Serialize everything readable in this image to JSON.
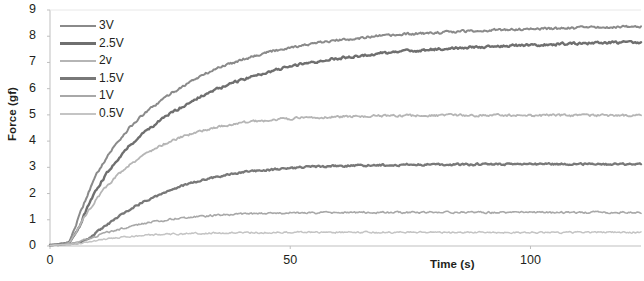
{
  "chart_data": {
    "type": "line",
    "title": "",
    "xlabel": "Time (s)",
    "ylabel": "Force (gf)",
    "xlim": [
      0,
      123
    ],
    "ylim": [
      0,
      9
    ],
    "xticks": [
      0,
      50,
      100
    ],
    "yticks": [
      0,
      1,
      2,
      3,
      4,
      5,
      6,
      7,
      8,
      9
    ],
    "grid": false,
    "legend_position": "top-left inside plot",
    "series": [
      {
        "name": "3V",
        "color": "#8a8a8a",
        "linewidth": 2.0,
        "plateau": 8.2,
        "delay": 3.5,
        "tau": 22,
        "noise": 0.075,
        "x": [
          0,
          2,
          4,
          6,
          8,
          10,
          12,
          14,
          16,
          18,
          20,
          25,
          30,
          35,
          40,
          45,
          50,
          55,
          60,
          65,
          70,
          75,
          80,
          85,
          90,
          95,
          100,
          105,
          110,
          115,
          120,
          123
        ],
        "values": [
          0.05,
          0.08,
          0.15,
          1.1,
          2.05,
          2.85,
          3.45,
          3.95,
          4.4,
          4.78,
          5.1,
          5.8,
          6.35,
          6.8,
          7.12,
          7.38,
          7.58,
          7.72,
          7.85,
          7.95,
          8.02,
          8.08,
          8.13,
          8.18,
          8.22,
          8.25,
          8.28,
          8.3,
          8.32,
          8.34,
          8.36,
          8.38
        ]
      },
      {
        "name": "2.5V",
        "color": "#6f6f6f",
        "linewidth": 2.4,
        "plateau": 7.5,
        "delay": 4.5,
        "tau": 26,
        "noise": 0.075,
        "x": [
          0,
          2,
          4,
          6,
          8,
          10,
          12,
          14,
          16,
          18,
          20,
          25,
          30,
          35,
          40,
          45,
          50,
          55,
          60,
          65,
          70,
          75,
          80,
          85,
          90,
          95,
          100,
          105,
          110,
          115,
          120,
          123
        ],
        "values": [
          0.04,
          0.06,
          0.12,
          0.7,
          1.55,
          2.25,
          2.82,
          3.3,
          3.72,
          4.08,
          4.4,
          5.05,
          5.58,
          6.0,
          6.35,
          6.62,
          6.85,
          7.02,
          7.16,
          7.27,
          7.36,
          7.44,
          7.5,
          7.55,
          7.6,
          7.64,
          7.67,
          7.7,
          7.72,
          7.74,
          7.76,
          7.78
        ]
      },
      {
        "name": "2v",
        "color": "#b5b5b5",
        "linewidth": 1.8,
        "plateau": 4.95,
        "delay": 4.0,
        "tau": 20,
        "noise": 0.07,
        "x": [
          0,
          2,
          4,
          6,
          8,
          10,
          12,
          14,
          16,
          18,
          20,
          25,
          30,
          35,
          40,
          45,
          50,
          55,
          60,
          65,
          70,
          75,
          80,
          85,
          90,
          95,
          100,
          105,
          110,
          115,
          120,
          123
        ],
        "values": [
          0.04,
          0.06,
          0.12,
          0.72,
          1.35,
          1.88,
          2.32,
          2.7,
          3.02,
          3.3,
          3.54,
          4.0,
          4.32,
          4.55,
          4.7,
          4.8,
          4.86,
          4.9,
          4.93,
          4.95,
          4.96,
          4.97,
          4.97,
          4.98,
          4.98,
          4.98,
          4.98,
          4.98,
          4.98,
          4.98,
          4.98,
          4.98
        ]
      },
      {
        "name": "1.5V",
        "color": "#787878",
        "linewidth": 2.3,
        "plateau": 3.12,
        "delay": 7.0,
        "tau": 22,
        "noise": 0.06,
        "x": [
          0,
          2,
          4,
          6,
          8,
          10,
          12,
          14,
          16,
          18,
          20,
          25,
          30,
          35,
          40,
          45,
          50,
          55,
          60,
          65,
          70,
          75,
          80,
          85,
          90,
          95,
          100,
          105,
          110,
          115,
          120,
          123
        ],
        "values": [
          0.03,
          0.05,
          0.08,
          0.12,
          0.28,
          0.55,
          0.82,
          1.08,
          1.32,
          1.54,
          1.74,
          2.14,
          2.44,
          2.65,
          2.8,
          2.9,
          2.97,
          3.02,
          3.05,
          3.07,
          3.09,
          3.1,
          3.11,
          3.11,
          3.12,
          3.12,
          3.12,
          3.12,
          3.12,
          3.12,
          3.12,
          3.12
        ]
      },
      {
        "name": "1V",
        "color": "#a8a8a8",
        "linewidth": 1.6,
        "plateau": 1.28,
        "delay": 5.0,
        "tau": 18,
        "noise": 0.055,
        "x": [
          0,
          2,
          4,
          6,
          8,
          10,
          12,
          14,
          16,
          18,
          20,
          25,
          30,
          35,
          40,
          45,
          50,
          55,
          60,
          65,
          70,
          75,
          80,
          85,
          90,
          95,
          100,
          105,
          110,
          115,
          120,
          123
        ],
        "values": [
          0.03,
          0.05,
          0.08,
          0.16,
          0.28,
          0.4,
          0.52,
          0.62,
          0.72,
          0.8,
          0.88,
          1.02,
          1.12,
          1.18,
          1.22,
          1.24,
          1.26,
          1.27,
          1.27,
          1.28,
          1.28,
          1.28,
          1.28,
          1.28,
          1.28,
          1.28,
          1.28,
          1.28,
          1.28,
          1.28,
          1.28,
          1.28
        ]
      },
      {
        "name": "0.5V",
        "color": "#c4c4c4",
        "linewidth": 1.5,
        "plateau": 0.52,
        "delay": 4.0,
        "tau": 16,
        "noise": 0.05,
        "x": [
          0,
          2,
          4,
          6,
          8,
          10,
          12,
          14,
          16,
          18,
          20,
          25,
          30,
          35,
          40,
          45,
          50,
          55,
          60,
          65,
          70,
          75,
          80,
          85,
          90,
          95,
          100,
          105,
          110,
          115,
          120,
          123
        ],
        "values": [
          0.02,
          0.04,
          0.06,
          0.1,
          0.16,
          0.22,
          0.27,
          0.31,
          0.35,
          0.38,
          0.41,
          0.45,
          0.48,
          0.5,
          0.51,
          0.51,
          0.52,
          0.52,
          0.52,
          0.52,
          0.52,
          0.52,
          0.52,
          0.52,
          0.52,
          0.52,
          0.52,
          0.52,
          0.52,
          0.52,
          0.52,
          0.52
        ]
      }
    ]
  },
  "axes": {
    "ylabel": "Force (gf)",
    "xlabel": "Time (s)",
    "ytick_labels": [
      "9",
      "8",
      "7",
      "6",
      "5",
      "4",
      "3",
      "2",
      "1",
      "0"
    ],
    "xtick_labels": [
      "0",
      "50",
      "100"
    ]
  },
  "legend": {
    "entries": [
      "3V",
      "2.5V",
      "2v",
      "1.5V",
      "1V",
      "0.5V"
    ]
  },
  "colors": {
    "axis": "#bfbfbf",
    "text": "#231f20",
    "background": "#ffffff"
  }
}
